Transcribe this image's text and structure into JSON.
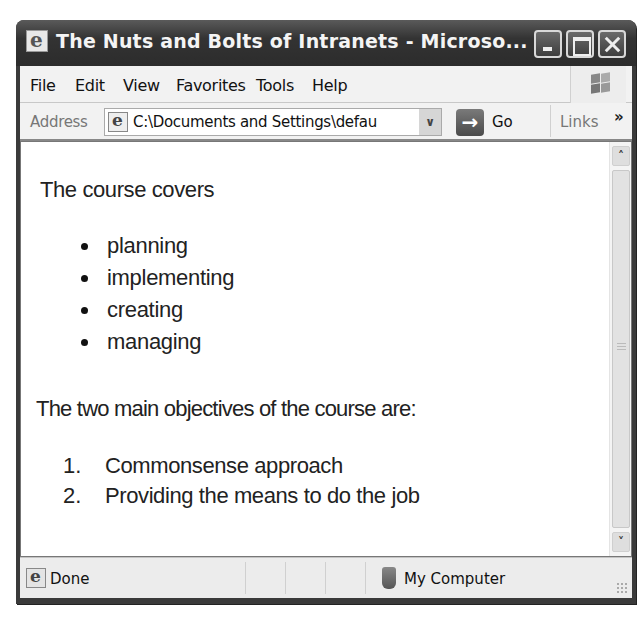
{
  "window": {
    "title": "The Nuts and Bolts of Intranets - Microso...",
    "controls": [
      "minimize",
      "maximize",
      "close"
    ]
  },
  "menubar": {
    "items": [
      {
        "label": "File"
      },
      {
        "label": "Edit"
      },
      {
        "label": "View"
      },
      {
        "label": "Favorites"
      },
      {
        "label": "Tools"
      },
      {
        "label": "Help"
      }
    ],
    "logo_icon": "windows-flag-icon"
  },
  "addressbar": {
    "label": "Address",
    "value": "C:\\Documents and Settings\\defau",
    "dropdown_glyph": "∨",
    "go_arrow": "→",
    "go_label": "Go",
    "links_label": "Links",
    "chevron": "»"
  },
  "content": {
    "intro": "The course covers",
    "bullets": [
      {
        "text": "planning"
      },
      {
        "text": "implementing"
      },
      {
        "text": "creating"
      },
      {
        "text": "managing"
      }
    ],
    "objectives_heading": "The two main objectives of the course are:",
    "objectives": [
      {
        "num": "1.",
        "text": "Commonsense approach"
      },
      {
        "num": "2.",
        "text": "Providing the means to do the job"
      }
    ]
  },
  "scrollbar": {
    "up_glyph": "˄",
    "down_glyph": "˅"
  },
  "statusbar": {
    "status": "Done",
    "zone": "My Computer"
  }
}
